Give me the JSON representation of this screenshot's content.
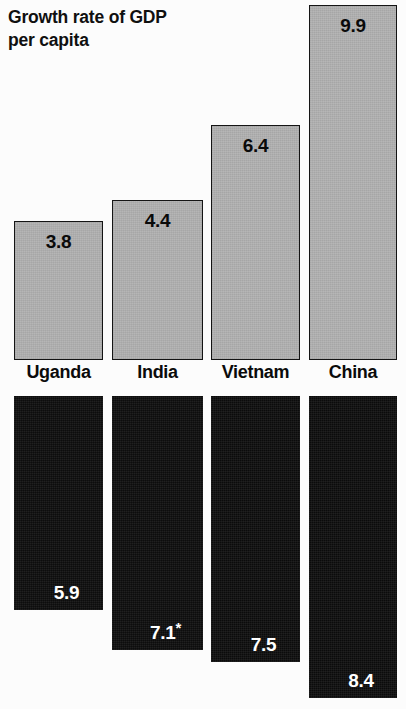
{
  "title": "Growth rate of GDP\nper capita",
  "chart_data": {
    "type": "bar",
    "title": "Growth rate of GDP per capita",
    "subtitle": "",
    "xlabel": "",
    "ylabel": "",
    "grid": false,
    "legend_position": "none",
    "orientation": "vertical-paired-mirror",
    "categories": [
      "Uganda",
      "India",
      "Vietnam",
      "China"
    ],
    "series": [
      {
        "name": "Growth rate of GDP per capita",
        "direction": "up",
        "color": "#b2b2b2",
        "label_color": "#0a0a0a",
        "values": [
          3.8,
          4.4,
          6.4,
          9.9
        ],
        "value_labels": [
          "3.8",
          "4.4",
          "6.4",
          "9.9"
        ],
        "ylim": [
          0,
          9.9
        ]
      },
      {
        "name": "Lower series",
        "direction": "down",
        "color": "#0d0d0d",
        "label_color": "#ffffff",
        "values": [
          5.9,
          7.1,
          7.5,
          8.4
        ],
        "value_labels": [
          "5.9",
          "7.1*",
          "7.5",
          "8.4"
        ],
        "footnote_marker": "*",
        "ylim": [
          0,
          8.4
        ]
      }
    ]
  },
  "bars": {
    "upper": [
      {
        "category": "Uganda",
        "value_label": "3.8",
        "left": 14,
        "width": 89,
        "top": 221,
        "bottom": 360
      },
      {
        "category": "India",
        "value_label": "4.4",
        "left": 112,
        "width": 91,
        "top": 200,
        "bottom": 360
      },
      {
        "category": "Vietnam",
        "value_label": "6.4",
        "left": 211,
        "width": 89,
        "top": 125,
        "bottom": 360
      },
      {
        "category": "China",
        "value_label": "9.9",
        "left": 309,
        "width": 88,
        "top": 5,
        "bottom": 360
      }
    ],
    "lower": [
      {
        "category": "Uganda",
        "value_label": "5.9",
        "value_main": "5.9",
        "asterisk": "",
        "left": 14,
        "width": 89,
        "top": 396,
        "bottom": 610
      },
      {
        "category": "India",
        "value_label": "7.1*",
        "value_main": "7.1",
        "asterisk": "*",
        "left": 112,
        "width": 91,
        "top": 396,
        "bottom": 650
      },
      {
        "category": "Vietnam",
        "value_label": "7.5",
        "value_main": "7.5",
        "asterisk": "",
        "left": 211,
        "width": 89,
        "top": 396,
        "bottom": 662
      },
      {
        "category": "China",
        "value_label": "8.4",
        "value_main": "8.4",
        "asterisk": "",
        "left": 309,
        "width": 88,
        "top": 396,
        "bottom": 698
      }
    ]
  },
  "labels": [
    {
      "text": "Uganda",
      "left": 14,
      "width": 89
    },
    {
      "text": "India",
      "left": 112,
      "width": 91
    },
    {
      "text": "Vietnam",
      "left": 205,
      "width": 101
    },
    {
      "text": "China",
      "left": 309,
      "width": 88
    }
  ]
}
